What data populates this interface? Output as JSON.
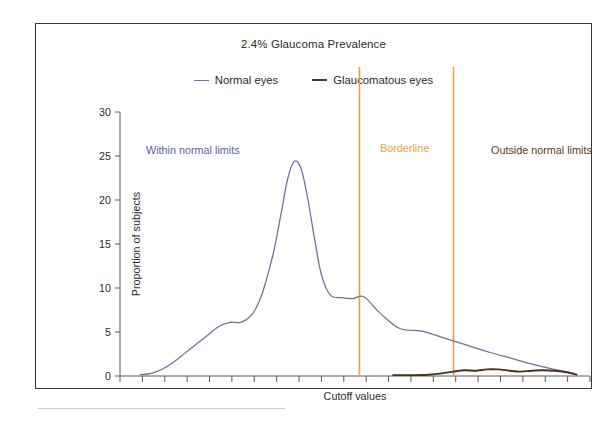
{
  "figure": {
    "background_color": "#ffffff",
    "frame_color": "#3a3a3a"
  },
  "title": "2.4% Glaucoma Prevalence",
  "legend": {
    "position": "top-center",
    "items": [
      {
        "label": "Normal eyes",
        "color": "#6b6fa6",
        "marker": "line"
      },
      {
        "label": "Glaucomatous eyes",
        "color": "#4a331d",
        "marker": "thick-line"
      }
    ]
  },
  "annotations": [
    {
      "name": "within-normal-limits",
      "text": "Within normal limits",
      "color": "#5a5fa0"
    },
    {
      "name": "borderline",
      "text": "Borderline",
      "color": "#e8a33d"
    },
    {
      "name": "outside-normal-limits",
      "text": "Outside normal limits",
      "color": "#5c3b24"
    }
  ],
  "axes": {
    "ylabel": "Proportion of subjects",
    "xlabel": "Cutoff values",
    "yticks": [
      0,
      5,
      10,
      15,
      20,
      25,
      30
    ],
    "ytick_labels": [
      "0",
      "5",
      "10",
      "15",
      "20",
      "25",
      "30"
    ],
    "ylim": [
      0,
      30
    ],
    "xlim": [
      0,
      21
    ],
    "x_tick_count": 22,
    "x_tick_labels": [],
    "grid": false
  },
  "chart_data": {
    "type": "line",
    "title": "2.4% Glaucoma Prevalence",
    "xlabel": "Cutoff values",
    "ylabel": "Proportion of subjects",
    "ylim": [
      0,
      30
    ],
    "xlim": [
      0,
      21
    ],
    "grid": false,
    "legend_position": "top-center",
    "vertical_markers": [
      {
        "name": "borderline-lower",
        "x": 10.7,
        "color": "#e8a33d",
        "label": "Borderline"
      },
      {
        "name": "borderline-upper",
        "x": 14.9,
        "color": "#e8a33d",
        "label": "Borderline"
      }
    ],
    "series": [
      {
        "name": "Normal eyes",
        "color": "#6b6fa6",
        "x": [
          0.9,
          1.4,
          1.9,
          2.4,
          2.9,
          3.4,
          3.9,
          4.4,
          4.9,
          5.4,
          5.9,
          6.3,
          6.6,
          6.9,
          7.2,
          7.5,
          7.8,
          8.1,
          8.4,
          8.7,
          9.0,
          9.4,
          9.9,
          10.4,
          10.9,
          11.6,
          12.5,
          13.5,
          14.5,
          15.5,
          16.5,
          17.5,
          18.5,
          19.5,
          20.3
        ],
        "y": [
          0.15,
          0.3,
          0.8,
          1.6,
          2.6,
          3.6,
          4.6,
          5.6,
          6.1,
          6.1,
          7.0,
          9.0,
          11.5,
          14.5,
          18.5,
          22.5,
          24.4,
          23.5,
          20.0,
          15.5,
          11.5,
          9.2,
          8.9,
          8.8,
          9.0,
          7.2,
          5.4,
          5.1,
          4.3,
          3.5,
          2.7,
          2.0,
          1.3,
          0.7,
          0.3
        ]
      },
      {
        "name": "Glaucomatous eyes",
        "color": "#4a331d",
        "x": [
          12.2,
          13.0,
          13.8,
          14.4,
          14.9,
          15.4,
          15.9,
          16.4,
          16.9,
          17.4,
          17.9,
          18.4,
          18.9,
          19.4,
          19.9,
          20.4
        ],
        "y": [
          0.1,
          0.1,
          0.15,
          0.3,
          0.5,
          0.65,
          0.6,
          0.75,
          0.75,
          0.6,
          0.5,
          0.6,
          0.65,
          0.6,
          0.45,
          0.15
        ]
      }
    ]
  }
}
